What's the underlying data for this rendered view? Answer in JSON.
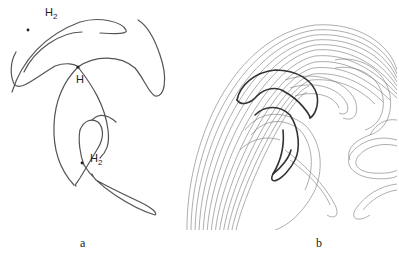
{
  "figure": {
    "panel_a": {
      "caption": "a",
      "labels": {
        "h2_top_base": "H",
        "h2_top_sub": "2",
        "h_center": "H",
        "h2_bottom_base": "H",
        "h2_bottom_sub": "2"
      }
    },
    "panel_b": {
      "caption": "b"
    }
  },
  "colors": {
    "line": "#555555",
    "dark_line": "#333333",
    "background": "#ffffff"
  }
}
